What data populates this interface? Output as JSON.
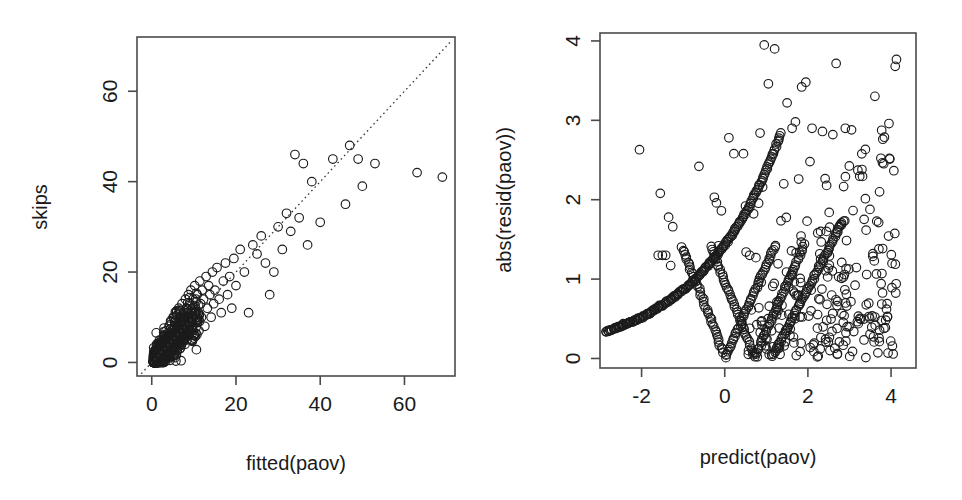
{
  "figure": {
    "background_color": "#ffffff",
    "ink_color": "#1c1c1c",
    "axis_color": "#4a4a4a",
    "panel_count": 2,
    "layout": "1 row x 2 columns"
  },
  "chart_data": [
    {
      "id": "left-panel",
      "type": "scatter",
      "title": "",
      "xlabel": "fitted(paov)",
      "ylabel": "skips",
      "xlim": [
        -3.5,
        72
      ],
      "ylim": [
        -3.0,
        72
      ],
      "xticks": [
        0,
        20,
        40,
        60
      ],
      "yticks": [
        0,
        20,
        40,
        60
      ],
      "xtick_labels": [
        "0",
        "20",
        "40",
        "60"
      ],
      "ytick_labels": [
        "0",
        "20",
        "40",
        "60"
      ],
      "grid": false,
      "legend": null,
      "point_style": {
        "marker": "open-circle",
        "radius_px": 4.3
      },
      "annotations": [
        {
          "kind": "reference-line",
          "style": "dotted",
          "description": "identity line y = x drawn from lower-left to upper-right corner",
          "from": [
            -2.5,
            -2.5
          ],
          "to": [
            71,
            71
          ]
        }
      ],
      "description": "Observed skips versus fitted values from a Poisson ANOVA; dense cluster of several hundred points near the origin, thinning along the identity line up to about (70, 42).",
      "n_points": 480,
      "series": [
        {
          "name": "observations",
          "points": [
            [
              0.6,
              0
            ],
            [
              0.8,
              0
            ],
            [
              1.0,
              1
            ],
            [
              1.1,
              0
            ],
            [
              1.2,
              2
            ],
            [
              1.3,
              0
            ],
            [
              1.4,
              1
            ],
            [
              1.5,
              3
            ],
            [
              1.6,
              0
            ],
            [
              1.7,
              2
            ],
            [
              1.8,
              1
            ],
            [
              1.9,
              4
            ],
            [
              2.0,
              0
            ],
            [
              2.1,
              3
            ],
            [
              2.2,
              2
            ],
            [
              2.3,
              5
            ],
            [
              2.4,
              1
            ],
            [
              2.5,
              3
            ],
            [
              2.6,
              0
            ],
            [
              2.7,
              4
            ],
            [
              2.8,
              2
            ],
            [
              2.9,
              6
            ],
            [
              3.0,
              1
            ],
            [
              3.1,
              3
            ],
            [
              3.2,
              5
            ],
            [
              3.3,
              2
            ],
            [
              3.4,
              7
            ],
            [
              3.5,
              3
            ],
            [
              3.6,
              1
            ],
            [
              3.7,
              4
            ],
            [
              3.8,
              6
            ],
            [
              3.9,
              2
            ],
            [
              4.0,
              5
            ],
            [
              4.1,
              8
            ],
            [
              4.2,
              3
            ],
            [
              4.3,
              1
            ],
            [
              4.4,
              6
            ],
            [
              4.5,
              4
            ],
            [
              4.6,
              9
            ],
            [
              4.7,
              2
            ],
            [
              4.8,
              7
            ],
            [
              4.9,
              5
            ],
            [
              5.0,
              3
            ],
            [
              5.1,
              10
            ],
            [
              5.2,
              6
            ],
            [
              5.3,
              4
            ],
            [
              5.4,
              8
            ],
            [
              5.5,
              2
            ],
            [
              5.6,
              7
            ],
            [
              5.7,
              5
            ],
            [
              5.8,
              11
            ],
            [
              5.9,
              3
            ],
            [
              6.0,
              9
            ],
            [
              6.1,
              6
            ],
            [
              6.2,
              4
            ],
            [
              6.3,
              8
            ],
            [
              6.4,
              12
            ],
            [
              6.5,
              5
            ],
            [
              6.6,
              7
            ],
            [
              6.7,
              3
            ],
            [
              6.8,
              10
            ],
            [
              6.9,
              6
            ],
            [
              7.0,
              9
            ],
            [
              7.1,
              4
            ],
            [
              7.2,
              13
            ],
            [
              7.3,
              7
            ],
            [
              7.4,
              5
            ],
            [
              7.5,
              11
            ],
            [
              7.6,
              8
            ],
            [
              7.7,
              6
            ],
            [
              7.8,
              10
            ],
            [
              7.9,
              4
            ],
            [
              8.0,
              14
            ],
            [
              8.1,
              9
            ],
            [
              8.2,
              7
            ],
            [
              8.3,
              12
            ],
            [
              8.4,
              5
            ],
            [
              8.5,
              11
            ],
            [
              8.6,
              8
            ],
            [
              8.7,
              15
            ],
            [
              8.8,
              6
            ],
            [
              8.9,
              10
            ],
            [
              9.0,
              13
            ],
            [
              9.1,
              7
            ],
            [
              9.2,
              9
            ],
            [
              9.3,
              16
            ],
            [
              9.4,
              11
            ],
            [
              9.5,
              5
            ],
            [
              9.6,
              12
            ],
            [
              9.7,
              8
            ],
            [
              9.8,
              14
            ],
            [
              9.9,
              10
            ],
            [
              10.0,
              6
            ],
            [
              10.2,
              17
            ],
            [
              10.4,
              12
            ],
            [
              10.6,
              9
            ],
            [
              10.8,
              15
            ],
            [
              11.0,
              11
            ],
            [
              11.2,
              7
            ],
            [
              11.4,
              18
            ],
            [
              11.6,
              13
            ],
            [
              11.8,
              10
            ],
            [
              12.0,
              16
            ],
            [
              12.3,
              14
            ],
            [
              12.6,
              8
            ],
            [
              12.9,
              19
            ],
            [
              13.2,
              12
            ],
            [
              13.5,
              17
            ],
            [
              13.8,
              15
            ],
            [
              14.1,
              10
            ],
            [
              14.4,
              20
            ],
            [
              14.7,
              13
            ],
            [
              15.0,
              16
            ],
            [
              15.5,
              21
            ],
            [
              16.0,
              14
            ],
            [
              16.5,
              11
            ],
            [
              17.0,
              18
            ],
            [
              17.5,
              22
            ],
            [
              18.0,
              15
            ],
            [
              18.5,
              19
            ],
            [
              19.0,
              12
            ],
            [
              19.5,
              23
            ],
            [
              20.0,
              17
            ],
            [
              21.0,
              25
            ],
            [
              22.0,
              20
            ],
            [
              23.0,
              11
            ],
            [
              24.0,
              26
            ],
            [
              25.0,
              24
            ],
            [
              26.0,
              28
            ],
            [
              27.0,
              22
            ],
            [
              28.0,
              15
            ],
            [
              29.0,
              20
            ],
            [
              30.0,
              30
            ],
            [
              31.0,
              25
            ],
            [
              32.0,
              33
            ],
            [
              33.0,
              29
            ],
            [
              34.0,
              46
            ],
            [
              35.0,
              32
            ],
            [
              36.0,
              44
            ],
            [
              37.0,
              26
            ],
            [
              38.0,
              40
            ],
            [
              40.0,
              31
            ],
            [
              43.0,
              45
            ],
            [
              46.0,
              35
            ],
            [
              47.0,
              48
            ],
            [
              49.0,
              45
            ],
            [
              50.0,
              39
            ],
            [
              53.0,
              44
            ],
            [
              63.0,
              42
            ],
            [
              69.0,
              41
            ]
          ]
        }
      ]
    },
    {
      "id": "right-panel",
      "type": "scatter",
      "title": "",
      "xlabel": "predict(paov)",
      "ylabel": "abs(resid(paov))",
      "xlim": [
        -3.0,
        4.6
      ],
      "ylim": [
        -0.12,
        4.1
      ],
      "xticks": [
        -2,
        0,
        2,
        4
      ],
      "yticks": [
        0,
        1,
        2,
        3,
        4
      ],
      "xtick_labels": [
        "-2",
        "0",
        "2",
        "4"
      ],
      "ytick_labels": [
        "0",
        "1",
        "2",
        "3",
        "4"
      ],
      "grid": false,
      "legend": null,
      "point_style": {
        "marker": "open-circle",
        "radius_px": 4.3
      },
      "annotations": [
        {
          "kind": "structure",
          "description": "Smooth dense arcs of overplotted points: an upward-sweeping branch of zero-count cases rising from (-2.8, 0.35) to (1.3, 2.85), plus V-shaped branches touching zero near x = 0 and x = 0.7."
        }
      ],
      "description": "Absolute deviance residuals versus linear predictor; discrete count structure produces smooth overplotted arcs on the left with a diffuse scatter of open circles spreading to the right.",
      "n_points": 520
    }
  ],
  "labels": {
    "left_y_title": "skips",
    "left_x_title": "fitted(paov)",
    "right_y_title": "abs(resid(paov))",
    "right_x_title": "predict(paov)"
  }
}
